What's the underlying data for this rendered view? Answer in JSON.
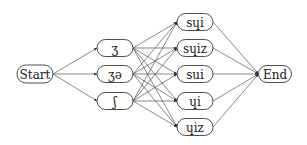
{
  "diagram": {
    "type": "lattice",
    "colors": {
      "edge": "#555555",
      "node_border": "#3a3a3a",
      "text": "#1a1a1a",
      "background": "#ffffff"
    },
    "nodes": {
      "start": {
        "label": "Start",
        "x": 35,
        "y": 74,
        "w": 36,
        "h": 18
      },
      "m0": {
        "label": "ʒ",
        "x": 115,
        "y": 48,
        "w": 36,
        "h": 17
      },
      "m1": {
        "label": "ʒə",
        "x": 115,
        "y": 74,
        "w": 36,
        "h": 17
      },
      "m2": {
        "label": "ʃ",
        "x": 115,
        "y": 101,
        "w": 36,
        "h": 17
      },
      "r0": {
        "label": "sɥi",
        "x": 195,
        "y": 22,
        "w": 36,
        "h": 17
      },
      "r1": {
        "label": "sɥiz",
        "x": 195,
        "y": 48,
        "w": 36,
        "h": 17
      },
      "r2": {
        "label": "sui",
        "x": 195,
        "y": 74,
        "w": 36,
        "h": 17
      },
      "r3": {
        "label": "ɥi",
        "x": 195,
        "y": 101,
        "w": 36,
        "h": 17
      },
      "r4": {
        "label": "ɥiz",
        "x": 195,
        "y": 127,
        "w": 36,
        "h": 17
      },
      "end": {
        "label": "End",
        "x": 275,
        "y": 74,
        "w": 33,
        "h": 17
      }
    },
    "columns": [
      [
        "start"
      ],
      [
        "m0",
        "m1",
        "m2"
      ],
      [
        "r0",
        "r1",
        "r2",
        "r3",
        "r4"
      ],
      [
        "end"
      ]
    ],
    "edges": [
      [
        "start",
        "m0",
        true
      ],
      [
        "start",
        "m1",
        true
      ],
      [
        "start",
        "m2",
        true
      ],
      [
        "m0",
        "r0",
        true
      ],
      [
        "m0",
        "r1",
        true
      ],
      [
        "m0",
        "r2",
        true
      ],
      [
        "m0",
        "r3",
        true
      ],
      [
        "m0",
        "r4",
        true
      ],
      [
        "m1",
        "r0",
        true
      ],
      [
        "m1",
        "r1",
        true
      ],
      [
        "m1",
        "r2",
        true
      ],
      [
        "m1",
        "r3",
        true
      ],
      [
        "m1",
        "r4",
        true
      ],
      [
        "m2",
        "r0",
        true
      ],
      [
        "m2",
        "r1",
        true
      ],
      [
        "m2",
        "r2",
        true
      ],
      [
        "m2",
        "r3",
        true
      ],
      [
        "m2",
        "r4",
        true
      ],
      [
        "r0",
        "end",
        true
      ],
      [
        "r1",
        "end",
        true
      ],
      [
        "r2",
        "end",
        true
      ],
      [
        "r3",
        "end",
        true
      ],
      [
        "r4",
        "end",
        true
      ]
    ]
  }
}
